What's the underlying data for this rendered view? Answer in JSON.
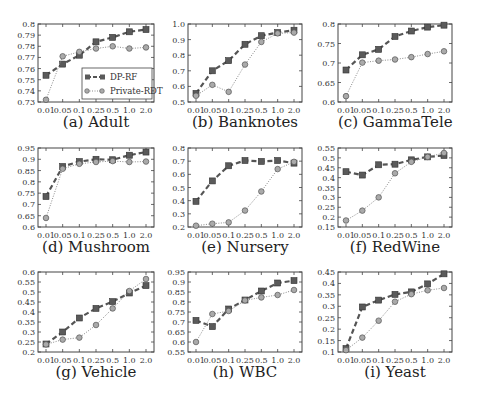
{
  "figure": {
    "x_tick_labels": [
      "0.01",
      "0.05",
      "0.1",
      "0.25",
      "0.5",
      "1.0",
      "2.0"
    ],
    "legend": [
      {
        "name": "DP-RF",
        "marker": "square",
        "line": "dashed",
        "color": "#555555"
      },
      {
        "name": "Private-RDT",
        "marker": "circle",
        "line": "dotted",
        "color": "#888888"
      }
    ],
    "colors": {
      "dp_rf": "#555555",
      "private_rdt": "#8a8a8a",
      "axis": "#444444"
    }
  },
  "chart_data": [
    {
      "type": "line",
      "id": "a",
      "title": "(a) Adult",
      "categories": [
        "0.01",
        "0.05",
        "0.1",
        "0.25",
        "0.5",
        "1.0",
        "2.0"
      ],
      "ylim": [
        0.73,
        0.8
      ],
      "yticks": [
        "0.73",
        "0.74",
        "0.75",
        "0.76",
        "0.77",
        "0.78",
        "0.79",
        "0.8"
      ],
      "series": [
        {
          "name": "DP-RF",
          "values": [
            0.754,
            0.764,
            0.772,
            0.784,
            0.788,
            0.793,
            0.795
          ]
        },
        {
          "name": "Private-RDT",
          "values": [
            0.732,
            0.771,
            0.775,
            0.778,
            0.78,
            0.778,
            0.779
          ]
        }
      ],
      "legend": true,
      "legend_position": "lower right",
      "grid": false
    },
    {
      "type": "line",
      "id": "b",
      "title": "(b) Banknotes",
      "categories": [
        "0.01",
        "0.05",
        "0.1",
        "0.25",
        "0.5",
        "1.0",
        "2.0"
      ],
      "ylim": [
        0.5,
        1.0
      ],
      "yticks": [
        "0.5",
        "0.6",
        "0.7",
        "0.8",
        "0.9",
        "1.0"
      ],
      "series": [
        {
          "name": "DP-RF",
          "values": [
            0.555,
            0.7,
            0.765,
            0.87,
            0.925,
            0.945,
            0.96
          ]
        },
        {
          "name": "Private-RDT",
          "values": [
            0.54,
            0.61,
            0.565,
            0.74,
            0.885,
            0.94,
            0.945
          ]
        }
      ],
      "legend": false,
      "grid": false
    },
    {
      "type": "line",
      "id": "c",
      "title": "(c) GammaTele",
      "categories": [
        "0.01",
        "0.05",
        "0.1",
        "0.25",
        "0.5",
        "1.0",
        "2.0"
      ],
      "ylim": [
        0.6,
        0.8
      ],
      "yticks": [
        "0.6",
        "0.65",
        "0.7",
        "0.75",
        "0.8"
      ],
      "series": [
        {
          "name": "DP-RF",
          "values": [
            0.682,
            0.721,
            0.735,
            0.768,
            0.782,
            0.792,
            0.797
          ]
        },
        {
          "name": "Private-RDT",
          "values": [
            0.615,
            0.701,
            0.706,
            0.709,
            0.715,
            0.723,
            0.73
          ]
        }
      ],
      "legend": false,
      "grid": false
    },
    {
      "type": "line",
      "id": "d",
      "title": "(d) Mushroom",
      "categories": [
        "0.01",
        "0.05",
        "0.1",
        "0.25",
        "0.5",
        "1.0",
        "2.0"
      ],
      "ylim": [
        0.6,
        0.95
      ],
      "yticks": [
        "0.6",
        "0.65",
        "0.7",
        "0.75",
        "0.8",
        "0.85",
        "0.9",
        "0.95"
      ],
      "series": [
        {
          "name": "DP-RF",
          "values": [
            0.735,
            0.868,
            0.89,
            0.9,
            0.898,
            0.918,
            0.932
          ]
        },
        {
          "name": "Private-RDT",
          "values": [
            0.64,
            0.858,
            0.88,
            0.888,
            0.892,
            0.888,
            0.89
          ]
        }
      ],
      "legend": false,
      "grid": false
    },
    {
      "type": "line",
      "id": "e",
      "title": "(e) Nursery",
      "categories": [
        "0.01",
        "0.05",
        "0.1",
        "0.25",
        "0.5",
        "1.0",
        "2.0"
      ],
      "ylim": [
        0.2,
        0.8
      ],
      "yticks": [
        "0.2",
        "0.3",
        "0.4",
        "0.5",
        "0.6",
        "0.7",
        "0.8"
      ],
      "series": [
        {
          "name": "DP-RF",
          "values": [
            0.395,
            0.55,
            0.665,
            0.705,
            0.698,
            0.705,
            0.685
          ]
        },
        {
          "name": "Private-RDT",
          "values": [
            0.21,
            0.225,
            0.235,
            0.325,
            0.47,
            0.64,
            0.695
          ]
        }
      ],
      "legend": false,
      "grid": false
    },
    {
      "type": "line",
      "id": "f",
      "title": "(f) RedWine",
      "categories": [
        "0.01",
        "0.05",
        "0.1",
        "0.25",
        "0.5",
        "1.0",
        "2.0"
      ],
      "ylim": [
        0.15,
        0.55
      ],
      "yticks": [
        "0.15",
        "0.2",
        "0.25",
        "0.3",
        "0.35",
        "0.4",
        "0.45",
        "0.5",
        "0.55"
      ],
      "series": [
        {
          "name": "DP-RF",
          "values": [
            0.43,
            0.413,
            0.465,
            0.468,
            0.49,
            0.505,
            0.512
          ]
        },
        {
          "name": "Private-RDT",
          "values": [
            0.183,
            0.233,
            0.3,
            0.422,
            0.48,
            0.505,
            0.525
          ]
        }
      ],
      "legend": false,
      "grid": false
    },
    {
      "type": "line",
      "id": "g",
      "title": "(g) Vehicle",
      "categories": [
        "0.01",
        "0.05",
        "0.1",
        "0.25",
        "0.5",
        "1.0",
        "2.0"
      ],
      "ylim": [
        0.2,
        0.6
      ],
      "yticks": [
        "0.2",
        "0.25",
        "0.3",
        "0.35",
        "0.4",
        "0.45",
        "0.5",
        "0.55",
        "0.6"
      ],
      "series": [
        {
          "name": "DP-RF",
          "values": [
            0.24,
            0.3,
            0.37,
            0.418,
            0.452,
            0.495,
            0.532
          ]
        },
        {
          "name": "Private-RDT",
          "values": [
            0.238,
            0.262,
            0.272,
            0.335,
            0.418,
            0.505,
            0.565
          ]
        }
      ],
      "legend": false,
      "grid": false
    },
    {
      "type": "line",
      "id": "h",
      "title": "(h) WBC",
      "categories": [
        "0.01",
        "0.05",
        "0.1",
        "0.25",
        "0.5",
        "1.0",
        "2.0"
      ],
      "ylim": [
        0.55,
        0.95
      ],
      "yticks": [
        "0.55",
        "0.6",
        "0.65",
        "0.7",
        "0.75",
        "0.8",
        "0.85",
        "0.9",
        "0.95"
      ],
      "series": [
        {
          "name": "DP-RF",
          "values": [
            0.708,
            0.677,
            0.765,
            0.81,
            0.855,
            0.895,
            0.907
          ]
        },
        {
          "name": "Private-RDT",
          "values": [
            0.6,
            0.74,
            0.755,
            0.808,
            0.823,
            0.835,
            0.86
          ]
        }
      ],
      "legend": false,
      "grid": false
    },
    {
      "type": "line",
      "id": "i",
      "title": "(i) Yeast",
      "categories": [
        "0.01",
        "0.05",
        "0.1",
        "0.25",
        "0.5",
        "1.0",
        "2.0"
      ],
      "ylim": [
        0.1,
        0.45
      ],
      "yticks": [
        "0.1",
        "0.15",
        "0.2",
        "0.25",
        "0.3",
        "0.35",
        "0.4",
        "0.45"
      ],
      "series": [
        {
          "name": "DP-RF",
          "values": [
            0.115,
            0.297,
            0.327,
            0.352,
            0.363,
            0.398,
            0.442
          ]
        },
        {
          "name": "Private-RDT",
          "values": [
            0.108,
            0.163,
            0.237,
            0.32,
            0.353,
            0.37,
            0.38
          ]
        }
      ],
      "legend": false,
      "grid": false
    }
  ]
}
